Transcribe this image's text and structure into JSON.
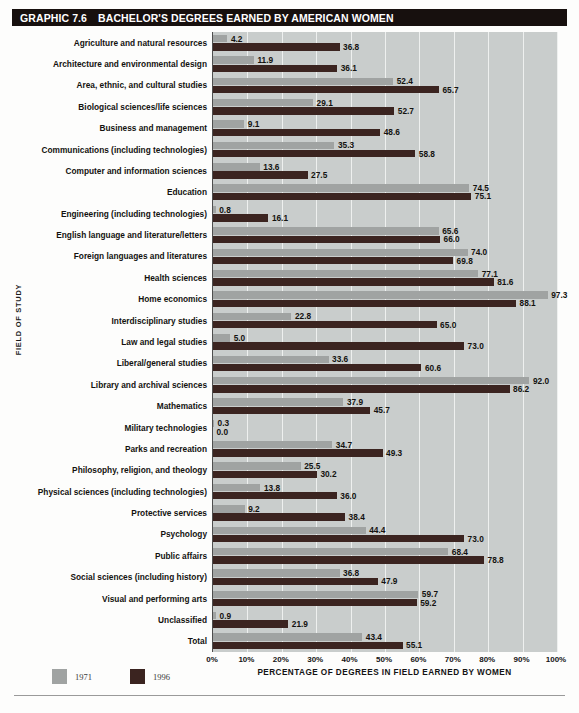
{
  "header": {
    "graphic_number": "GRAPHIC 7.6",
    "title": "BACHELOR'S DEGREES EARNED BY AMERICAN WOMEN"
  },
  "legend": {
    "items": [
      {
        "label": "1971",
        "color": "#a0a3a2"
      },
      {
        "label": "1996",
        "color": "#3b2420"
      }
    ]
  },
  "axes": {
    "ylabel": "FIELD OF STUDY",
    "xlabel": "PERCENTAGE OF DEGREES IN FIELD EARNED BY WOMEN",
    "xticks": [
      "0%",
      "10%",
      "20%",
      "30%",
      "40%",
      "50%",
      "60%",
      "70%",
      "80%",
      "90%",
      "100%"
    ]
  },
  "chart_data": {
    "type": "bar",
    "orientation": "horizontal",
    "title": "BACHELOR'S DEGREES EARNED BY AMERICAN WOMEN",
    "xlabel": "PERCENTAGE OF DEGREES IN FIELD EARNED BY WOMEN",
    "ylabel": "FIELD OF STUDY",
    "xlim": [
      0,
      100
    ],
    "grid": true,
    "legend_position": "bottom-left",
    "categories": [
      "Agriculture and natural resources",
      "Architecture and environmental design",
      "Area, ethnic, and cultural studies",
      "Biological sciences/life sciences",
      "Business and management",
      "Communications (including technologies)",
      "Computer and information sciences",
      "Education",
      "Engineering (including technologies)",
      "English language and literature/letters",
      "Foreign languages and literatures",
      "Health sciences",
      "Home economics",
      "Interdisciplinary studies",
      "Law and legal studies",
      "Liberal/general studies",
      "Library and archival sciences",
      "Mathematics",
      "Military technologies",
      "Parks and recreation",
      "Philosophy, religion, and theology",
      "Physical sciences (including technologies)",
      "Protective services",
      "Psychology",
      "Public affairs",
      "Social sciences (including history)",
      "Visual and performing arts",
      "Unclassified",
      "Total"
    ],
    "series": [
      {
        "name": "1971",
        "color": "#a0a3a2",
        "values": [
          4.2,
          11.9,
          52.4,
          29.1,
          9.1,
          35.3,
          13.6,
          74.5,
          0.8,
          65.6,
          74.0,
          77.1,
          97.3,
          22.8,
          5.0,
          33.6,
          92.0,
          37.9,
          0.3,
          34.7,
          25.5,
          13.8,
          9.2,
          44.4,
          68.4,
          36.8,
          59.7,
          0.9,
          43.4
        ]
      },
      {
        "name": "1996",
        "color": "#3b2420",
        "values": [
          36.8,
          36.1,
          65.7,
          52.7,
          48.6,
          58.8,
          27.5,
          75.1,
          16.1,
          66.0,
          69.8,
          81.6,
          88.1,
          65.0,
          73.0,
          60.6,
          86.2,
          45.7,
          0.0,
          49.3,
          30.2,
          36.0,
          38.4,
          73.0,
          78.8,
          47.9,
          59.2,
          21.9,
          55.1
        ]
      }
    ]
  }
}
